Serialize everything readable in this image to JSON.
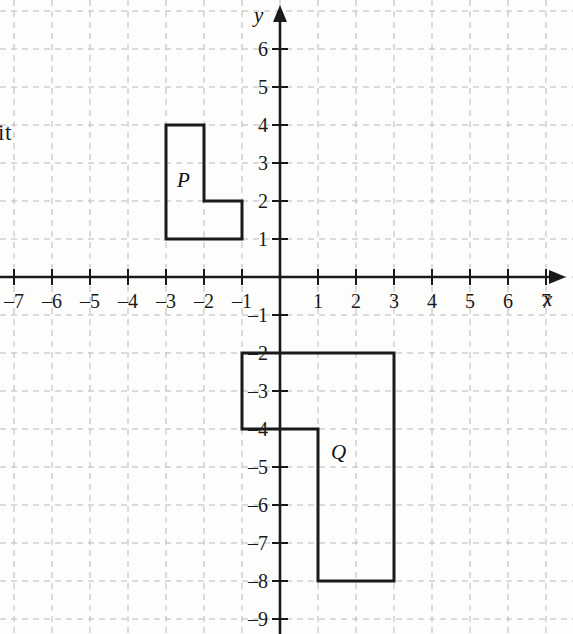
{
  "figure": {
    "kind": "cartesian-coordinate-grid",
    "background_color": "#fdfdfc",
    "grid_color": "#b9b9b9",
    "axis_color": "#1a1a1a",
    "shape_stroke_color": "#1a1a1a",
    "cropped_margin_text": "it"
  },
  "axes": {
    "x_name": "x",
    "y_name": "y",
    "x_min": -7,
    "x_max": 7,
    "y_min": -9,
    "y_max": 6,
    "x_tick_labels": [
      "–7",
      "–6",
      "–5",
      "–4",
      "–3",
      "–2",
      "–1",
      "1",
      "2",
      "3",
      "4",
      "5",
      "6",
      "7"
    ],
    "x_tick_values": [
      -7,
      -6,
      -5,
      -4,
      -3,
      -2,
      -1,
      1,
      2,
      3,
      4,
      5,
      6,
      7
    ],
    "y_tick_labels": [
      "6",
      "5",
      "4",
      "3",
      "2",
      "1",
      "–1",
      "–2",
      "–3",
      "–4",
      "–5",
      "–6",
      "–7",
      "–8",
      "–9"
    ],
    "y_tick_values": [
      6,
      5,
      4,
      3,
      2,
      1,
      -1,
      -2,
      -3,
      -4,
      -5,
      -6,
      -7,
      -8,
      -9
    ]
  },
  "chart_data": {
    "type": "scatter",
    "title": "",
    "xlabel": "x",
    "ylabel": "y",
    "xlim": [
      -7.5,
      7.6
    ],
    "ylim": [
      -9.4,
      6.6
    ],
    "grid": true,
    "legend": "none",
    "shapes": [
      {
        "name": "P",
        "label": "P",
        "label_position": [
          -2.55,
          2.55
        ],
        "type": "L-shaped polygon",
        "vertices": [
          [
            -3,
            4
          ],
          [
            -2,
            4
          ],
          [
            -2,
            2
          ],
          [
            -1,
            2
          ],
          [
            -1,
            1
          ],
          [
            -3,
            1
          ]
        ]
      },
      {
        "name": "Q",
        "label": "Q",
        "label_position": [
          1.5,
          -4.6
        ],
        "type": "L-shaped polygon",
        "vertices": [
          [
            -1,
            -2
          ],
          [
            3,
            -2
          ],
          [
            3,
            -8
          ],
          [
            1,
            -8
          ],
          [
            1,
            -4
          ],
          [
            -1,
            -4
          ]
        ]
      }
    ]
  }
}
